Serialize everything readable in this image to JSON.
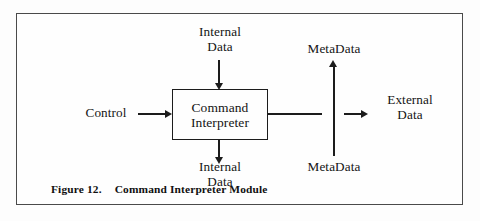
{
  "figure": {
    "caption_label": "Figure 12.",
    "caption_title": "Command Interpreter Module",
    "frame_color": "#4a4a4a",
    "line_color": "#1c1c1c",
    "background_color": "#fdfdfd"
  },
  "diagram": {
    "type": "block-diagram",
    "process": {
      "name": "command-interpreter",
      "line1": "Command",
      "line2": "Interpreter"
    },
    "labels": {
      "internal_data_top_line1": "Internal",
      "internal_data_top_line2": "Data",
      "internal_data_bottom_line1": "Internal",
      "internal_data_bottom_line2": "Data",
      "control": "Control",
      "external_data_line1": "External",
      "external_data_line2": "Data",
      "metadata_top": "MetaData",
      "metadata_bottom": "MetaData"
    },
    "flows": [
      {
        "id": "internal-data-in",
        "from": "Internal Data",
        "to": "Command Interpreter",
        "direction": "down",
        "arrowhead": true
      },
      {
        "id": "control-in",
        "from": "Control",
        "to": "Command Interpreter",
        "direction": "right",
        "arrowhead": true
      },
      {
        "id": "internal-data-out",
        "from": "Command Interpreter",
        "to": "Internal Data",
        "direction": "down",
        "arrowhead": true
      },
      {
        "id": "external-data-out",
        "from": "Command Interpreter",
        "to": "External Data",
        "direction": "right",
        "arrowhead": true
      },
      {
        "id": "metadata-up",
        "from": "MetaData",
        "to": "MetaData",
        "direction": "up",
        "arrowhead": true
      }
    ]
  }
}
